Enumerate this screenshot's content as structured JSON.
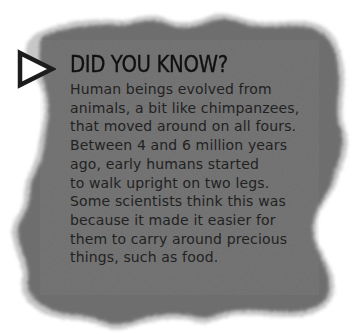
{
  "panel": {
    "fill_color": "#6e6e6e",
    "edge_style": "rough-torn-blurred",
    "background": "#ffffff"
  },
  "marker": {
    "icon": "play-triangle-icon",
    "fill": "#ffffff",
    "stroke": "#1a1a1a"
  },
  "heading": "DID YOU KNOW?",
  "body_lines": [
    "Human beings evolved from",
    "animals, a bit like chimpanzees,",
    "that moved around on all fours.",
    "Between 4 and 6 million years",
    "ago, early humans started",
    "to walk upright on two legs.",
    "Some scientists think this was",
    "because it made it easier for",
    "them to carry around precious",
    "things, such as food."
  ]
}
